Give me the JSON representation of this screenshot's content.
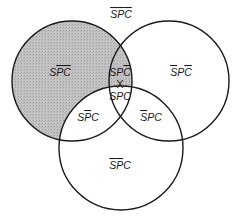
{
  "diagram": {
    "type": "venn-3",
    "colors": {
      "stroke": "#1a1a1a",
      "shade": "#bdbdbd",
      "background": "#ffffff"
    },
    "circles": [
      {
        "name": "S",
        "cx": 72,
        "cy": 81,
        "r": 60
      },
      {
        "name": "P",
        "cx": 169,
        "cy": 81,
        "r": 60
      },
      {
        "name": "C",
        "cx": 121,
        "cy": 148,
        "r": 62
      }
    ],
    "regions": [
      {
        "id": "outside",
        "parts": [
          {
            "t": "S",
            "bar": true
          },
          {
            "t": "P",
            "bar": true
          },
          {
            "t": "C",
            "bar": true
          }
        ],
        "x": 121,
        "y": 18
      },
      {
        "id": "s-only",
        "parts": [
          {
            "t": "S",
            "bar": false
          },
          {
            "t": "P",
            "bar": true
          },
          {
            "t": "C",
            "bar": true
          }
        ],
        "x": 60,
        "y": 76
      },
      {
        "id": "s-and-p",
        "parts": [
          {
            "t": "S",
            "bar": false
          },
          {
            "t": "P",
            "bar": false
          },
          {
            "t": "C",
            "bar": true
          }
        ],
        "x": 120,
        "y": 76
      },
      {
        "id": "p-only",
        "parts": [
          {
            "t": "S",
            "bar": true
          },
          {
            "t": "P",
            "bar": false
          },
          {
            "t": "C",
            "bar": true
          }
        ],
        "x": 181,
        "y": 76
      },
      {
        "id": "s-p-c",
        "parts": [
          {
            "t": "S",
            "bar": false
          },
          {
            "t": "P",
            "bar": false
          },
          {
            "t": "C",
            "bar": false
          }
        ],
        "x": 120,
        "y": 100
      },
      {
        "id": "s-and-c",
        "parts": [
          {
            "t": "S",
            "bar": false
          },
          {
            "t": "P",
            "bar": true
          },
          {
            "t": "C",
            "bar": false
          }
        ],
        "x": 88,
        "y": 121
      },
      {
        "id": "p-and-c",
        "parts": [
          {
            "t": "S",
            "bar": true
          },
          {
            "t": "P",
            "bar": false
          },
          {
            "t": "C",
            "bar": false
          }
        ],
        "x": 151,
        "y": 121
      },
      {
        "id": "c-only",
        "parts": [
          {
            "t": "S",
            "bar": true
          },
          {
            "t": "P",
            "bar": true
          },
          {
            "t": "C",
            "bar": false
          }
        ],
        "x": 120,
        "y": 169
      }
    ],
    "shaded_regions": [
      "s-only",
      "s-and-p"
    ],
    "marker": {
      "symbol": "X",
      "x": 120,
      "y": 88
    }
  }
}
